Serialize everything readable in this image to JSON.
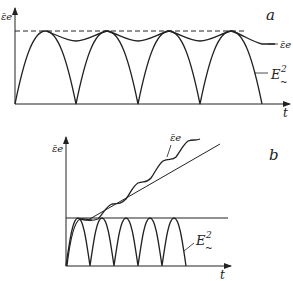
{
  "figure": {
    "panels": [
      {
        "id": "a",
        "label": "a",
        "y_axis_label": "ε̄e",
        "x_axis_label": "t",
        "curves": [
          {
            "name": "E²~",
            "label_main": "E",
            "label_sup": "2",
            "label_sub": "~",
            "description": "rectified sine, |sin| oscillation between 0 and saturation level"
          },
          {
            "name": "ε̄e",
            "label": "ε̄e",
            "description": "mean energy oscillating just below the saturation level"
          }
        ],
        "reference_line": {
          "style": "dashed",
          "description": "saturation level"
        }
      },
      {
        "id": "b",
        "label": "b",
        "y_axis_label": "ε̄e",
        "x_axis_label": "t",
        "curves": [
          {
            "name": "E²~",
            "label_main": "E",
            "label_sup": "2",
            "label_sub": "~",
            "description": "rectified sine oscillation below a horizontal level"
          },
          {
            "name": "ε̄e",
            "label": "ε̄e",
            "description": "linearly growing mean energy with superimposed oscillation"
          }
        ],
        "reference_line": {
          "style": "solid",
          "description": "horizontal level of E² amplitude"
        }
      }
    ],
    "colors": {
      "line": "#222222",
      "background": "#ffffff"
    }
  }
}
